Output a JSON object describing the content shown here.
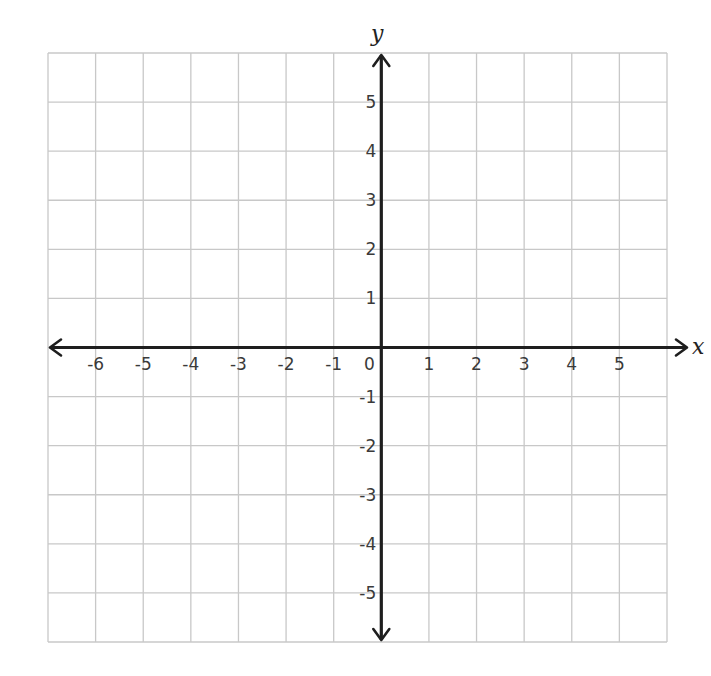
{
  "chart_data": {
    "type": "scatter",
    "title": "",
    "xlabel": "x",
    "ylabel": "y",
    "xlim": [
      -7,
      6
    ],
    "ylim": [
      -6,
      6
    ],
    "grid": true,
    "x_ticks": [
      -6,
      -5,
      -4,
      -3,
      -2,
      -1,
      0,
      1,
      2,
      3,
      4,
      5
    ],
    "y_ticks": [
      5,
      4,
      3,
      2,
      1,
      -1,
      -2,
      -3,
      -4,
      -5
    ],
    "series": []
  },
  "colors": {
    "grid": "#c8c8c8",
    "axis": "#1e1e1e",
    "tick_text": "#3a3a3a",
    "background": "#ffffff"
  },
  "layout": {
    "grid_left": 48,
    "grid_top": 53,
    "grid_right": 667,
    "grid_bottom": 642,
    "origin_x": 382,
    "origin_y": 349
  }
}
